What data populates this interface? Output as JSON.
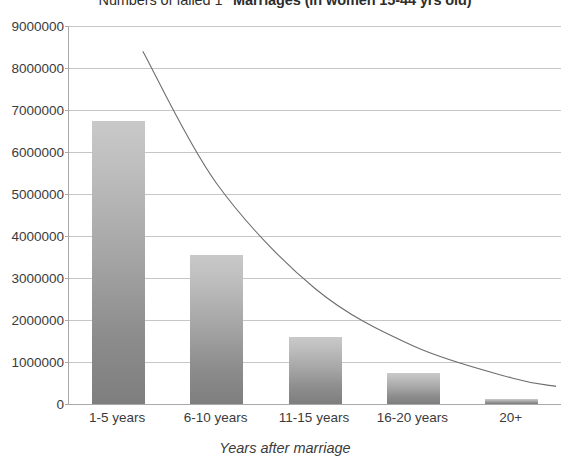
{
  "chart_data": {
    "type": "bar",
    "title_parts": {
      "lead": "Numbers of failed 1",
      "superscript": "st",
      "bold": "Marriages (in women 15-44 yrs old)"
    },
    "categories": [
      "1-5 years",
      "6-10 years",
      "11-15 years",
      "16-20 years",
      "20+"
    ],
    "values": [
      6750000,
      3550000,
      1600000,
      730000,
      120000
    ],
    "series": [
      {
        "name": "Number of failed 1st marriages",
        "values": [
          6750000,
          3550000,
          1600000,
          730000,
          120000
        ]
      }
    ],
    "trendline": {
      "type": "exponential",
      "x": [
        0.25,
        1,
        2,
        3,
        4,
        4.45
      ],
      "y": [
        8400000,
        5250000,
        2750000,
        1380000,
        620000,
        420000
      ]
    },
    "xlabel": "Years after marriage",
    "ylabel": "",
    "ylim": [
      0,
      9000000
    ],
    "ytick_values": [
      0,
      1000000,
      2000000,
      3000000,
      4000000,
      5000000,
      6000000,
      7000000,
      8000000,
      9000000
    ],
    "ytick_labels": [
      "0",
      "1000000",
      "2000000",
      "3000000",
      "4000000",
      "5000000",
      "6000000",
      "7000000",
      "8000000",
      "9000000"
    ],
    "grid": true,
    "legend": false,
    "colors": {
      "bar_top": "#c9c9c9",
      "bar_bottom": "#7e7e7e",
      "gridline": "#c6c6c6",
      "axis": "#a9a9a9",
      "trendline": "#6e6e6e",
      "text": "#3b3b3b"
    }
  }
}
